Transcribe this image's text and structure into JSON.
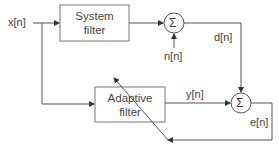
{
  "diagram": {
    "type": "adaptive filter block diagram",
    "blocks": [
      {
        "id": "system_filter",
        "label_line1": "System",
        "label_line2": "filter"
      },
      {
        "id": "adaptive_filter",
        "label_line1": "Adaptive",
        "label_line2": "filter"
      }
    ],
    "summers": [
      {
        "id": "sum1",
        "symbol": "Σ"
      },
      {
        "id": "sum2",
        "symbol": "Σ"
      }
    ],
    "signals": {
      "input": "x[n]",
      "noise": "n[n]",
      "desired": "d[n]",
      "output": "y[n]",
      "error": "e[n]"
    },
    "colors": {
      "line": "#555555",
      "box_border": "#777777",
      "text": "#444444"
    }
  }
}
